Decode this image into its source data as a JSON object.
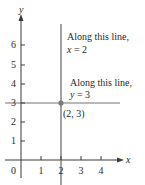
{
  "diagram": {
    "type": "coordinate-plane",
    "axes": {
      "x_label": "x",
      "y_label": "y",
      "origin_label": "0",
      "x_ticks": [
        "1",
        "2",
        "3",
        "4"
      ],
      "y_ticks": [
        "1",
        "2",
        "3",
        "4",
        "5",
        "6"
      ]
    },
    "lines": [
      {
        "equation": "x = 2",
        "orientation": "vertical",
        "color": "#6e6e6e"
      },
      {
        "equation": "y = 3",
        "orientation": "horizontal",
        "color": "#b8b8b8"
      }
    ],
    "annotations": {
      "vertical_line_title": "Along this line,",
      "vertical_line_eq_var": "x",
      "vertical_line_eq_rest": " = 2",
      "horizontal_line_title": "Along this line,",
      "horizontal_line_eq_var": "y",
      "horizontal_line_eq_rest": " = 3"
    },
    "point": {
      "label": "(2, 3)",
      "x": 2,
      "y": 3,
      "color": "#7a7a7a"
    },
    "colors": {
      "axis": "#3a3a3a",
      "text": "#2a2a2a",
      "background": "#ffffff"
    }
  }
}
